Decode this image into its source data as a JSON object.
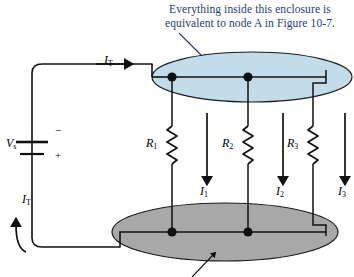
{
  "figure": {
    "type": "circuit-diagram",
    "title_caption": {
      "line1": "Everything inside this enclosure is",
      "line2": "equivalent to node A in Figure 10-7.",
      "color": "#2b3a78"
    },
    "colors": {
      "top_enclosure_fill": "#c2dcea",
      "bottom_enclosure_fill": "#a8a8a8",
      "enclosure_stroke": "#1a1a1a",
      "wire": "#111111",
      "caption_text": "#2b3a78",
      "background": "#ffffff"
    },
    "source": {
      "label": "V",
      "label_sub": "s",
      "minus_sign": "−",
      "plus_sign": "+",
      "symbol": "battery-dc-source"
    },
    "currents": {
      "total_top": {
        "label": "I",
        "sub": "T",
        "direction": "right"
      },
      "total_bottom": {
        "label": "I",
        "sub": "T",
        "direction": "up"
      },
      "branches": [
        {
          "label": "I",
          "sub": "1",
          "direction": "down"
        },
        {
          "label": "I",
          "sub": "2",
          "direction": "down"
        },
        {
          "label": "I",
          "sub": "3",
          "direction": "down"
        }
      ]
    },
    "resistors": [
      {
        "label": "R",
        "sub": "1"
      },
      {
        "label": "R",
        "sub": "2"
      },
      {
        "label": "R",
        "sub": "3"
      }
    ],
    "nodes": {
      "top_enclosure_dots": 2,
      "bottom_enclosure_dots": 2
    },
    "annotations": {
      "pointer_to_top_enclosure": "arrow",
      "pointer_to_bottom_enclosure": "arrow"
    }
  }
}
